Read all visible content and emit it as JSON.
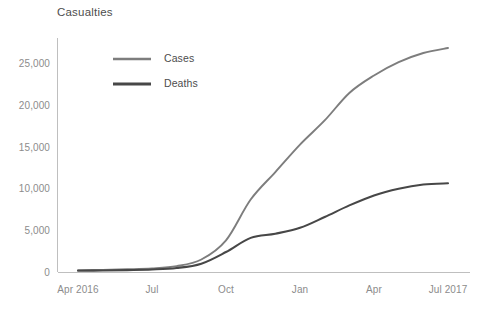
{
  "chart_data": {
    "type": "line",
    "title": "Casualties",
    "xlabel": "",
    "ylabel": "",
    "ylim": [
      0,
      28000
    ],
    "yticks": [
      0,
      5000,
      10000,
      15000,
      20000,
      25000
    ],
    "ytick_labels": [
      "0",
      "5,000",
      "10,000",
      "15,000",
      "20,000",
      "25,000"
    ],
    "xtick_labels": [
      "Apr 2016",
      "Jul",
      "Oct",
      "Jan",
      "Apr",
      "Jul 2017"
    ],
    "x": [
      "Apr 2016",
      "May 2016",
      "Jun 2016",
      "Jul 2016",
      "Aug 2016",
      "Sep 2016",
      "Oct 2016",
      "Nov 2016",
      "Dec 2016",
      "Jan 2017",
      "Feb 2017",
      "Mar 2017",
      "Apr 2017",
      "May 2017",
      "Jun 2017",
      "Jul 2017"
    ],
    "grid": false,
    "legend_position": "upper-left-inside",
    "series": [
      {
        "name": "Cases",
        "color": "#7d7d7d",
        "values": [
          220,
          260,
          330,
          430,
          700,
          1500,
          3800,
          8700,
          12000,
          15300,
          18200,
          21500,
          23600,
          25200,
          26300,
          26900
        ]
      },
      {
        "name": "Deaths",
        "color": "#474747",
        "values": [
          150,
          180,
          230,
          300,
          480,
          1000,
          2400,
          4100,
          4600,
          5300,
          6600,
          8000,
          9200,
          10000,
          10500,
          10650
        ]
      }
    ]
  },
  "legend": {
    "items": [
      {
        "label": "Cases"
      },
      {
        "label": "Deaths"
      }
    ]
  }
}
